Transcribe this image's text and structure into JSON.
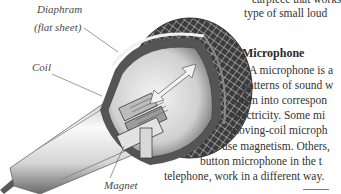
{
  "illustration": {
    "subject": "cutaway moving-coil microphone",
    "labels": {
      "diaphram_line1": "Diaphram",
      "diaphram_line2": "(flat sheet)",
      "coil": "Coil",
      "magnet": "Magnet"
    },
    "icons": [
      "microphone-cutaway-illustration",
      "double-arrow-icon"
    ]
  },
  "article": {
    "top_lines": [
      "earpiece that works",
      "type of small loud"
    ],
    "heading": "Microphone",
    "paragraph_lines": [
      "A microphone is a",
      "patterns of sound w",
      "them into correspon",
      "electricity. Some mi",
      "moving-coil microph",
      "use magnetism. Others,",
      "button microphone in the t",
      "telephone, work in a different way."
    ]
  },
  "colors": {
    "text": "#333333",
    "label": "#4a4a4a",
    "background": "#ffffff"
  }
}
